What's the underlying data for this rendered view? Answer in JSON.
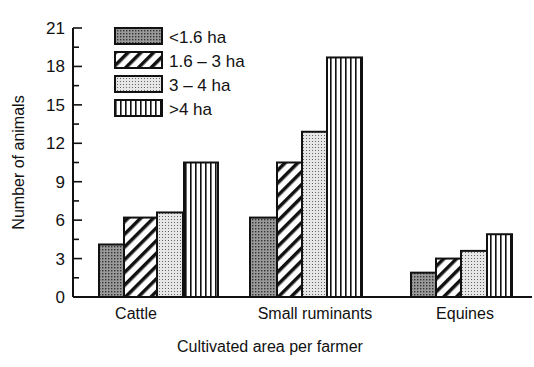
{
  "chart_data": {
    "type": "bar",
    "title": "",
    "xlabel": "Cultivated area per farmer",
    "ylabel": "Number of animals",
    "ylim": [
      0,
      21
    ],
    "yticks": [
      0,
      3,
      6,
      9,
      12,
      15,
      18,
      21
    ],
    "grid": false,
    "legend_position": "upper-left (inside)",
    "categories": [
      "Cattle",
      "Small ruminants",
      "Equines"
    ],
    "series": [
      {
        "name": "<1.6 ha",
        "pattern": "dense-dots",
        "values": [
          4.1,
          6.2,
          1.9
        ]
      },
      {
        "name": "1.6 – 3 ha",
        "pattern": "diagonal-hatch",
        "values": [
          6.2,
          10.5,
          3.0
        ]
      },
      {
        "name": "3 – 4 ha",
        "pattern": "light-dots",
        "values": [
          6.6,
          12.9,
          3.6
        ]
      },
      {
        "name": ">4 ha",
        "pattern": "vertical-lines",
        "values": [
          10.5,
          18.7,
          4.9
        ]
      }
    ]
  }
}
